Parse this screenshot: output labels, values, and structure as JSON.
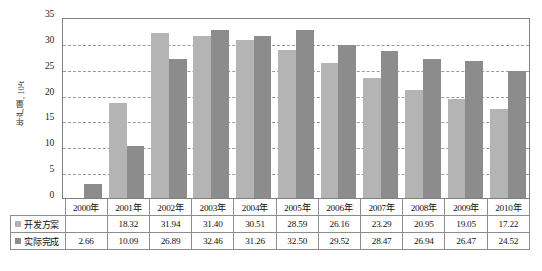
{
  "chart_data": {
    "type": "bar",
    "title": "",
    "xlabel": "",
    "ylabel": "年产量, 10⁴t",
    "ylim": [
      0,
      35
    ],
    "yticks": [
      0,
      5,
      10,
      15,
      20,
      25,
      30,
      35
    ],
    "grid": true,
    "legend_position": "table-row-labels",
    "categories": [
      "2000年",
      "2001年",
      "2002年",
      "2003年",
      "2004年",
      "2005年",
      "2006年",
      "2007年",
      "2008年",
      "2009年",
      "2010年"
    ],
    "series": [
      {
        "name": "开发方案",
        "color": "#b4b4b4",
        "values": [
          null,
          18.32,
          31.94,
          31.4,
          30.51,
          28.59,
          26.16,
          23.29,
          20.95,
          19.05,
          17.22
        ],
        "display": [
          "",
          "18.32",
          "31.94",
          "31.40",
          "30.51",
          "28.59",
          "26.16",
          "23.29",
          "20.95",
          "19.05",
          "17.22"
        ]
      },
      {
        "name": "实际完成",
        "color": "#8c8c8c",
        "values": [
          2.66,
          10.09,
          26.89,
          32.46,
          31.26,
          32.5,
          29.52,
          28.47,
          26.94,
          26.47,
          24.52
        ],
        "display": [
          "2.66",
          "10.09",
          "26.89",
          "32.46",
          "31.26",
          "32.50",
          "29.52",
          "28.47",
          "26.94",
          "26.47",
          "24.52"
        ]
      }
    ]
  },
  "table": {
    "corner_label": "",
    "row_labels": [
      "开发方案",
      "实际完成"
    ]
  },
  "caption": {
    "text": ""
  },
  "colors": {
    "plan": "#b4b4b4",
    "actual": "#8c8c8c",
    "axis": "#808080",
    "grid": "#9a9a9a"
  }
}
